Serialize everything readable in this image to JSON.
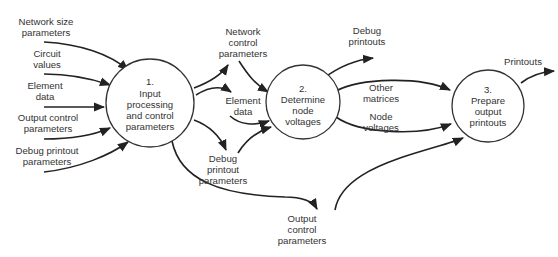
{
  "processes": [
    {
      "number": "1.",
      "lines": [
        "Input",
        "processing",
        "and control",
        "parameters"
      ]
    },
    {
      "number": "2.",
      "lines": [
        "Determine",
        "node",
        "voltages"
      ]
    },
    {
      "number": "3.",
      "lines": [
        "Prepare",
        "output",
        "printouts"
      ]
    }
  ],
  "inputs": [
    {
      "lines": [
        "Network size",
        "parameters"
      ]
    },
    {
      "lines": [
        "Circuit",
        "values"
      ]
    },
    {
      "lines": [
        "Element",
        "data"
      ]
    },
    {
      "lines": [
        "Output control",
        "parameters"
      ]
    },
    {
      "lines": [
        "Debug printout",
        "parameters"
      ]
    }
  ],
  "p1_outputs": [
    {
      "lines": [
        "Network",
        "control",
        "parameters"
      ]
    },
    {
      "lines": [
        "Element",
        "data"
      ]
    },
    {
      "lines": [
        "Debug",
        "printout",
        "parameters"
      ]
    },
    {
      "lines": [
        "Output",
        "control",
        "parameters"
      ]
    }
  ],
  "p2_outputs": [
    {
      "lines": [
        "Debug",
        "printouts"
      ]
    },
    {
      "lines": [
        "Other",
        "matrices"
      ]
    },
    {
      "lines": [
        "Node",
        "voltages"
      ]
    }
  ],
  "p3_outputs": [
    {
      "lines": [
        "Printouts"
      ]
    }
  ],
  "colors": {
    "stroke": "#222222",
    "text": "#333333",
    "background": "#ffffff"
  }
}
